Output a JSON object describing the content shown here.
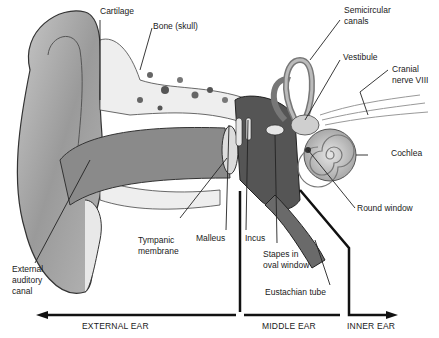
{
  "diagram": {
    "labels": {
      "cartilage": "Cartilage",
      "bone_skull": "Bone (skull)",
      "semicircular_canals_1": "Semicircular",
      "semicircular_canals_2": "canals",
      "vestibule": "Vestibule",
      "cranial_nerve_1": "Cranial",
      "cranial_nerve_2": "nerve VIII",
      "cochlea": "Cochlea",
      "round_window": "Round window",
      "tympanic_membrane_1": "Tympanic",
      "tympanic_membrane_2": "membrane",
      "malleus": "Malleus",
      "incus": "Incus",
      "stapes_1": "Stapes in",
      "stapes_2": "oval window",
      "eustachian_tube": "Eustachian tube",
      "external_auditory_canal_1": "External",
      "external_auditory_canal_2": "auditory",
      "external_auditory_canal_3": "canal"
    },
    "regions": {
      "external": "EXTERNAL EAR",
      "middle": "MIDDLE EAR",
      "inner": "INNER EAR"
    }
  }
}
